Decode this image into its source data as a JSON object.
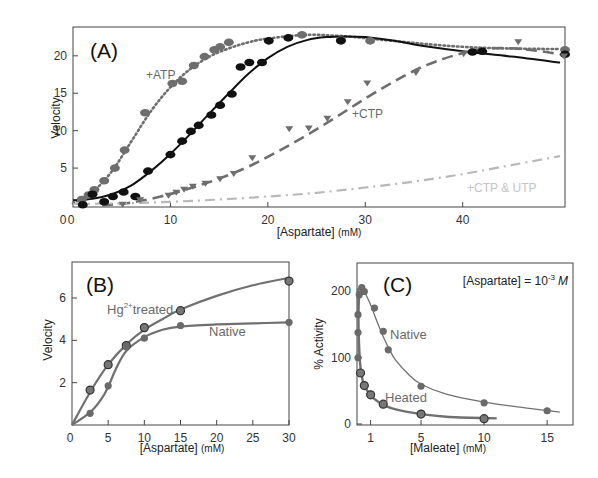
{
  "chart_data": [
    {
      "id": "A",
      "type": "scatter",
      "panel_label": "(A)",
      "xlabel": "[Aspartate]",
      "xlabel_unit": "(mM)",
      "ylabel": "Velocity",
      "xlim": [
        0,
        50
      ],
      "ylim": [
        0,
        23.5
      ],
      "xticks": [
        0,
        10,
        20,
        30,
        40
      ],
      "yticks": [
        5,
        10,
        15,
        20
      ],
      "grid": false,
      "series": [
        {
          "name": "+ATP",
          "label": "+ATP",
          "color": "#6e6e6e",
          "line": "dotted",
          "marker": "circle",
          "points": [
            [
              0.9,
              0.8
            ],
            [
              1.6,
              1.4
            ],
            [
              2.2,
              2.1
            ],
            [
              3.2,
              3.3
            ],
            [
              4.3,
              5.0
            ],
            [
              5.3,
              7.4
            ],
            [
              7.4,
              12.4
            ],
            [
              10.2,
              16.3
            ],
            [
              11.2,
              16.6
            ],
            [
              12.4,
              18.7
            ],
            [
              13.5,
              19.9
            ],
            [
              14.5,
              20.8
            ],
            [
              15.1,
              21.2
            ],
            [
              16.0,
              21.8
            ],
            [
              23.5,
              22.8
            ],
            [
              27.5,
              22.1
            ],
            [
              30.5,
              22.0
            ],
            [
              50.5,
              20.8
            ]
          ],
          "curve": [
            [
              0,
              0.3
            ],
            [
              2,
              1.8
            ],
            [
              4,
              4.6
            ],
            [
              6,
              8.6
            ],
            [
              8,
              12.6
            ],
            [
              10,
              15.8
            ],
            [
              12,
              18.2
            ],
            [
              14,
              19.9
            ],
            [
              16,
              21.0
            ],
            [
              18,
              21.8
            ],
            [
              20,
              22.3
            ],
            [
              24,
              22.8
            ],
            [
              28,
              22.6
            ],
            [
              32,
              22.1
            ],
            [
              36,
              21.6
            ],
            [
              40,
              21.2
            ],
            [
              44,
              21.0
            ],
            [
              50,
              20.9
            ]
          ]
        },
        {
          "name": "No effector",
          "label": "",
          "color": "#111111",
          "line": "solid",
          "marker": "circle",
          "points": [
            [
              1.0,
              0.1
            ],
            [
              2.0,
              1.5
            ],
            [
              3.2,
              0.5
            ],
            [
              4.1,
              1.2
            ],
            [
              5.2,
              1.8
            ],
            [
              6.4,
              1.2
            ],
            [
              7.7,
              4.6
            ],
            [
              10.0,
              6.8
            ],
            [
              11.2,
              8.6
            ],
            [
              12.1,
              9.9
            ],
            [
              12.9,
              10.7
            ],
            [
              14.2,
              12.1
            ],
            [
              15.1,
              13.4
            ],
            [
              16.3,
              14.9
            ],
            [
              17.2,
              18.5
            ],
            [
              18.1,
              19.1
            ],
            [
              19.4,
              19.1
            ],
            [
              20.1,
              22.0
            ],
            [
              22.1,
              22.4
            ],
            [
              27.5,
              22.0
            ],
            [
              41.0,
              20.5
            ],
            [
              42.0,
              20.6
            ],
            [
              50.5,
              20.2
            ]
          ],
          "curve": [
            [
              0,
              0.7
            ],
            [
              2,
              0.9
            ],
            [
              4,
              1.5
            ],
            [
              6,
              2.7
            ],
            [
              8,
              4.6
            ],
            [
              10,
              6.9
            ],
            [
              12,
              9.5
            ],
            [
              14,
              12.3
            ],
            [
              16,
              15.0
            ],
            [
              18,
              17.6
            ],
            [
              20,
              19.7
            ],
            [
              22,
              21.2
            ],
            [
              24,
              22.1
            ],
            [
              26,
              22.5
            ],
            [
              28,
              22.6
            ],
            [
              30,
              22.5
            ],
            [
              33,
              22.0
            ],
            [
              36,
              21.3
            ],
            [
              40,
              20.6
            ],
            [
              45,
              19.9
            ],
            [
              50,
              19.1
            ]
          ]
        },
        {
          "name": "+CTP",
          "label": "+CTP",
          "color": "#6e6e6e",
          "line": "dashed",
          "marker": "triangle-down",
          "points": [
            [
              5.1,
              0.1
            ],
            [
              6.9,
              0.7
            ],
            [
              9.8,
              1.3
            ],
            [
              10.6,
              1.7
            ],
            [
              11.4,
              2.1
            ],
            [
              12.3,
              2.5
            ],
            [
              13.6,
              2.9
            ],
            [
              15.1,
              3.5
            ],
            [
              16.5,
              4.2
            ],
            [
              18.4,
              6.3
            ],
            [
              22.2,
              10.2
            ],
            [
              24.2,
              10.3
            ],
            [
              26.1,
              11.6
            ],
            [
              28.2,
              13.8
            ],
            [
              30.2,
              16.3
            ],
            [
              35.2,
              17.7
            ],
            [
              40.1,
              20.2
            ],
            [
              45.7,
              21.8
            ],
            [
              50.4,
              19.9
            ]
          ],
          "curve": [
            [
              3,
              0
            ],
            [
              6,
              0.4
            ],
            [
              9,
              1.2
            ],
            [
              12,
              2.3
            ],
            [
              15,
              3.6
            ],
            [
              18,
              5.2
            ],
            [
              21,
              7.2
            ],
            [
              24,
              9.4
            ],
            [
              27,
              11.8
            ],
            [
              30,
              14.3
            ],
            [
              33,
              16.6
            ],
            [
              36,
              18.6
            ],
            [
              39,
              20.0
            ],
            [
              42,
              20.9
            ],
            [
              45,
              21.0
            ],
            [
              48,
              20.6
            ],
            [
              50,
              20.2
            ]
          ]
        },
        {
          "name": "+CTP & UTP",
          "label": "+CTP & UTP",
          "color": "#b8b8b8",
          "line": "dashdot",
          "marker": "none",
          "points": [],
          "curve": [
            [
              0,
              0.2
            ],
            [
              5,
              0.3
            ],
            [
              10,
              0.5
            ],
            [
              15,
              0.8
            ],
            [
              20,
              1.2
            ],
            [
              25,
              1.7
            ],
            [
              30,
              2.4
            ],
            [
              35,
              3.2
            ],
            [
              40,
              4.2
            ],
            [
              45,
              5.4
            ],
            [
              50,
              6.6
            ]
          ]
        }
      ]
    },
    {
      "id": "B",
      "type": "line",
      "panel_label": "(B)",
      "xlabel": "[Aspartate]",
      "xlabel_unit": "(mM)",
      "ylabel": "Velocity",
      "xlim": [
        0,
        30
      ],
      "ylim": [
        0,
        7.7
      ],
      "xticks": [
        0,
        5,
        10,
        15,
        20,
        25,
        30
      ],
      "yticks": [
        2,
        4,
        6
      ],
      "grid": false,
      "series": [
        {
          "name": "Hg2+ treated",
          "label": "Hg",
          "label_sup": "2+",
          "label_rest": "treated",
          "color": "#707070",
          "marker": "circle-outlined",
          "points": [
            [
              2.5,
              1.65
            ],
            [
              5,
              2.85
            ],
            [
              7.5,
              3.75
            ],
            [
              10,
              4.6
            ],
            [
              15,
              5.4
            ],
            [
              30,
              6.8
            ]
          ],
          "curve": [
            [
              0,
              0
            ],
            [
              2.5,
              1.55
            ],
            [
              5,
              2.85
            ],
            [
              7.5,
              3.8
            ],
            [
              10,
              4.5
            ],
            [
              12.5,
              5.0
            ],
            [
              15,
              5.45
            ],
            [
              20,
              6.1
            ],
            [
              25,
              6.6
            ],
            [
              30,
              6.95
            ]
          ]
        },
        {
          "name": "Native",
          "label": "Native",
          "color": "#707070",
          "marker": "circle",
          "points": [
            [
              2.5,
              0.55
            ],
            [
              5,
              1.85
            ],
            [
              7.5,
              3.7
            ],
            [
              10,
              4.1
            ],
            [
              15,
              4.7
            ],
            [
              30,
              4.85
            ]
          ],
          "curve": [
            [
              0,
              0
            ],
            [
              2.5,
              0.6
            ],
            [
              4,
              1.2
            ],
            [
              5,
              1.8
            ],
            [
              6,
              2.6
            ],
            [
              7.5,
              3.5
            ],
            [
              10,
              4.15
            ],
            [
              12.5,
              4.5
            ],
            [
              15,
              4.65
            ],
            [
              20,
              4.75
            ],
            [
              25,
              4.8
            ],
            [
              30,
              4.85
            ]
          ]
        }
      ]
    },
    {
      "id": "C",
      "type": "line",
      "panel_label": "(C)",
      "xlabel": "[Maleate]",
      "xlabel_unit": "(mM)",
      "ylabel": "% Activity",
      "xlim": [
        0,
        17
      ],
      "ylim": [
        0,
        240
      ],
      "xticks": [
        1,
        5,
        10,
        15
      ],
      "yticks": [
        0,
        100,
        200
      ],
      "grid": false,
      "annotation": {
        "text": "[Aspartate] = 10",
        "sup": "-3",
        "unit": "M"
      },
      "series": [
        {
          "name": "Native",
          "label": "Native",
          "color": "#707070",
          "marker": "circle",
          "points": [
            [
              0,
              100
            ],
            [
              0,
              138
            ],
            [
              0,
              165
            ],
            [
              0.1,
              195
            ],
            [
              0.3,
              206
            ],
            [
              0.5,
              200
            ],
            [
              1.3,
              175
            ],
            [
              2,
              140
            ],
            [
              2.4,
              112
            ],
            [
              5,
              57
            ],
            [
              10,
              32
            ],
            [
              15,
              20
            ]
          ],
          "curve": [
            [
              0,
              100
            ],
            [
              0.05,
              160
            ],
            [
              0.15,
              195
            ],
            [
              0.3,
              205
            ],
            [
              0.5,
              200
            ],
            [
              1,
              180
            ],
            [
              1.5,
              155
            ],
            [
              2,
              132
            ],
            [
              2.5,
              112
            ],
            [
              3,
              96
            ],
            [
              4,
              75
            ],
            [
              5,
              60
            ],
            [
              7,
              45
            ],
            [
              10,
              33
            ],
            [
              13,
              25
            ],
            [
              16,
              18
            ]
          ]
        },
        {
          "name": "Heated",
          "label": "Heated",
          "color": "#707070",
          "marker": "circle-outlined",
          "points": [
            [
              0.2,
              77
            ],
            [
              0.5,
              58
            ],
            [
              1,
              44
            ],
            [
              2,
              30
            ],
            [
              5,
              15
            ],
            [
              10,
              8
            ]
          ],
          "curve": [
            [
              0,
              205
            ],
            [
              0.05,
              140
            ],
            [
              0.15,
              95
            ],
            [
              0.3,
              72
            ],
            [
              0.5,
              58
            ],
            [
              1,
              43
            ],
            [
              1.5,
              35
            ],
            [
              2,
              29
            ],
            [
              3,
              22
            ],
            [
              5,
              15
            ],
            [
              7,
              11
            ],
            [
              10,
              9
            ],
            [
              11,
              8.5
            ]
          ]
        }
      ]
    }
  ]
}
